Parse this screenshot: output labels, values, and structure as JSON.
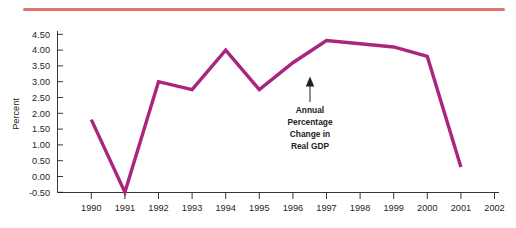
{
  "decor": {
    "top_rule_color": "#d9534f"
  },
  "chart_data": {
    "type": "line",
    "title": "",
    "subtitle": "",
    "xlabel": "",
    "ylabel": "Percent",
    "ylim": [
      -0.5,
      4.5
    ],
    "ytick_step": 0.5,
    "grid": false,
    "legend_position": "none",
    "line_color": "#a9257e",
    "categories": [
      "1990",
      "1991",
      "1992",
      "1993",
      "1994",
      "1995",
      "1996",
      "1997",
      "1998",
      "1999",
      "2000",
      "2001",
      "2002"
    ],
    "x_tick_labels": [
      "1990",
      "1991",
      "1992",
      "1993",
      "1994",
      "1995",
      "1996",
      "1997",
      "1998",
      "1999",
      "2000",
      "2001",
      "2002"
    ],
    "y_tick_labels": [
      "4.50",
      "4.00",
      "3.50",
      "3.00",
      "2.50",
      "2.00",
      "1.50",
      "1.00",
      "0.50",
      "0.00",
      "-0.50"
    ],
    "series": [
      {
        "name": "Annual Percentage Change in Real GDP",
        "x": [
          "1990",
          "1991",
          "1992",
          "1993",
          "1994",
          "1995",
          "1996",
          "1997",
          "1998",
          "1999",
          "2000",
          "2001"
        ],
        "values": [
          1.8,
          -0.5,
          3.0,
          2.75,
          4.0,
          2.75,
          3.6,
          4.3,
          4.2,
          4.1,
          3.8,
          0.3
        ]
      }
    ],
    "annotations": [
      {
        "name": "series-callout",
        "lines": [
          "Annual",
          "Percentage",
          "Change in",
          "Real GDP"
        ],
        "arrow": "up"
      }
    ]
  }
}
